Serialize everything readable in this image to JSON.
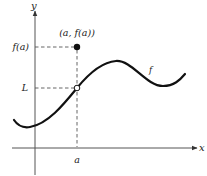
{
  "figure": {
    "axes": {
      "x_label": "x",
      "y_label": "y"
    },
    "labels": {
      "point": "(a, f(a))",
      "f_of_a": "f(a)",
      "limit": "L",
      "a": "a",
      "function": "f"
    },
    "markers": {
      "filled_point": "(a, f(a))",
      "open_point": "(a, L)"
    },
    "colors": {
      "curve": "#111111",
      "axes": "#555555",
      "text": "#222222"
    }
  }
}
